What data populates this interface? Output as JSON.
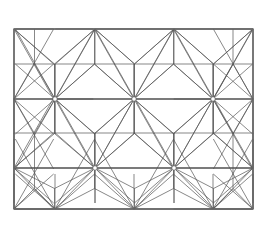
{
  "figure": {
    "title": "Asanoha geometric lattice pattern",
    "background_color": "#ffffff",
    "line_color": "#555555",
    "frame_color": "#6a6a6a",
    "hub_fill_color": "#ffffff",
    "line_width": 0.7,
    "frame_line_width": 1.4
  },
  "geometry": {
    "canvas": {
      "width": 272,
      "height": 227
    },
    "frame": {
      "x": 14,
      "y": 29,
      "width": 239,
      "height": 180
    },
    "rows_y": [
      29,
      64,
      99,
      133,
      168,
      209
    ],
    "hub_rows": [
      {
        "y": 29,
        "type": "edge-top",
        "x_positions": [
          14,
          95,
          174,
          253
        ]
      },
      {
        "y": 99,
        "type": "interior",
        "x_positions": [
          14,
          55,
          134,
          213,
          253
        ]
      },
      {
        "y": 168,
        "type": "interior",
        "x_positions": [
          14,
          95,
          174,
          253
        ]
      },
      {
        "y": 209,
        "type": "edge-bottom",
        "x_positions": [
          14,
          55,
          134,
          213,
          253
        ]
      }
    ],
    "horizontal_rules_y": [
      64,
      99,
      133,
      168
    ],
    "vertical_rules_x": [
      55,
      95,
      134,
      174,
      213
    ],
    "star_rays": 12,
    "hub_node_radius": 2.2,
    "band_height": 35,
    "hub_spacing_x": 79.3
  },
  "labels": {
    "none": ""
  }
}
